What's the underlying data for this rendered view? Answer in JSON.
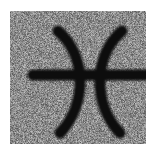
{
  "image": {
    "title": "Pisces zodiac symbol",
    "subject": "pisces-symbol",
    "unicode_glyph": "♓",
    "medium": "noisy grayscale scan",
    "width": 156,
    "height": 153
  },
  "canvas": {
    "background_color": "#ffffff"
  },
  "plate": {
    "name": "noisy-gray-plate",
    "fill_color": "#8c8c8c",
    "x": 10,
    "y": 11,
    "width": 136,
    "height": 133,
    "noise": {
      "amplitude": 58,
      "mean_level": 140,
      "grain_px": 1,
      "seed": 20240517
    }
  },
  "glyph": {
    "name": "pisces-glyph",
    "ink_color": "#0d0d0d",
    "stroke_width": 11,
    "viewbox": "0 0 136 133",
    "parts": [
      {
        "name": "left-crescent-arc",
        "shape": "arc-bulging-right",
        "path": "M 48 20 C 76 44 78 92 50 122"
      },
      {
        "name": "right-crescent-arc",
        "shape": "arc-bulging-left",
        "path": "M 112 20 C 84 44 82 92 110 122"
      },
      {
        "name": "horizontal-cross-bar",
        "shape": "straight-line",
        "path": "M 23 64 L 137 64"
      }
    ]
  }
}
